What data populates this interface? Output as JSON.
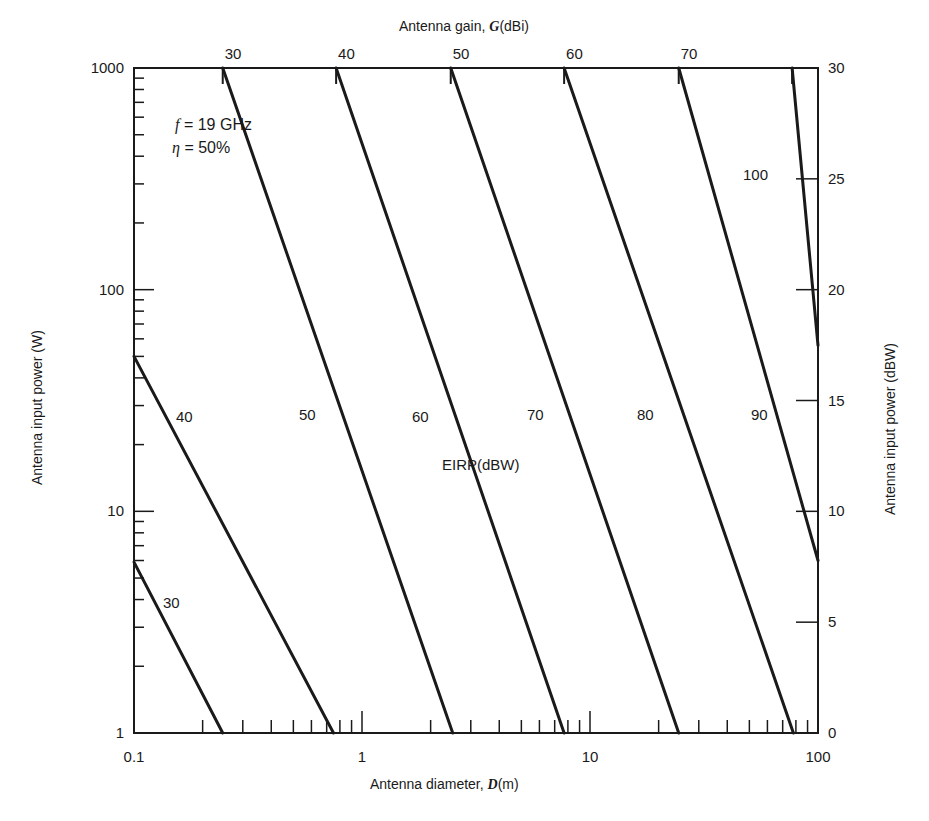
{
  "chart_data": {
    "type": "line",
    "title": "",
    "xlabel": "Antenna diameter, D(m)",
    "xlabel_prefix": "Antenna diameter, ",
    "xlabel_var": "D",
    "xlabel_unit": "(m)",
    "ylabel": "Antenna input power (W)",
    "y2label": "Antenna input power (dBW)",
    "x2label": "Antenna gain, G(dBi)",
    "x2label_prefix": "Antenna gain, ",
    "x2label_var": "G",
    "x2label_unit": "(dBi)",
    "xscale": "log",
    "yscale": "log",
    "xlim": [
      0.1,
      100
    ],
    "ylim": [
      1,
      1000
    ],
    "x_ticks": [
      "0.1",
      "1",
      "10",
      "100"
    ],
    "y_ticks": [
      "1",
      "10",
      "100",
      "1000"
    ],
    "y2_ticks": [
      "0",
      "5",
      "10",
      "15",
      "20",
      "25",
      "30"
    ],
    "x2_ticks": [
      "30",
      "40",
      "50",
      "60",
      "70"
    ],
    "annotations": [
      "f = 19 GHz",
      "η = 50%",
      "EIRP(dBW)"
    ],
    "annotation_freq": "= 19 GHz",
    "annotation_eff": "= 50%",
    "annotation_eirp": "EIRP(dBW)",
    "grid": false,
    "legend": "none (lines labeled inline)",
    "series": [
      {
        "name": "30",
        "points": [
          [
            0.1,
            5.9
          ],
          [
            0.245,
            1
          ]
        ]
      },
      {
        "name": "40",
        "points": [
          [
            0.1,
            50
          ],
          [
            0.75,
            1
          ]
        ]
      },
      {
        "name": "50",
        "points": [
          [
            0.245,
            1000
          ],
          [
            2.5,
            1
          ]
        ]
      },
      {
        "name": "60",
        "points": [
          [
            0.77,
            1000
          ],
          [
            7.7,
            1
          ]
        ]
      },
      {
        "name": "70",
        "points": [
          [
            2.45,
            1000
          ],
          [
            24.5,
            1
          ]
        ]
      },
      {
        "name": "80",
        "points": [
          [
            7.7,
            1000
          ],
          [
            78,
            1
          ]
        ]
      },
      {
        "name": "90",
        "points": [
          [
            24.5,
            1000
          ],
          [
            100,
            6
          ]
        ]
      },
      {
        "name": "100",
        "points": [
          [
            77,
            1000
          ],
          [
            100,
            56
          ]
        ]
      }
    ],
    "line_labels": [
      {
        "text": "30",
        "x_px": 163,
        "y_px": 603
      },
      {
        "text": "40",
        "x_px": 176,
        "y_px": 417
      },
      {
        "text": "50",
        "x_px": 299,
        "y_px": 415
      },
      {
        "text": "60",
        "x_px": 412,
        "y_px": 417
      },
      {
        "text": "70",
        "x_px": 527,
        "y_px": 415
      },
      {
        "text": "80",
        "x_px": 637,
        "y_px": 415
      },
      {
        "text": "90",
        "x_px": 751,
        "y_px": 415
      },
      {
        "text": "100",
        "x_px": 743,
        "y_px": 175
      }
    ],
    "line_color": "#1a1a1a"
  }
}
